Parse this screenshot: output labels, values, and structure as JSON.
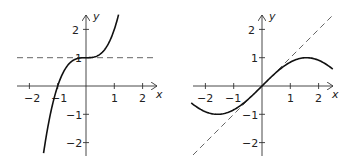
{
  "chart_data": [
    {
      "type": "line",
      "title": "",
      "xlabel": "x",
      "ylabel": "y",
      "xlim": [
        -2.5,
        2.5
      ],
      "ylim": [
        -2.5,
        2.5
      ],
      "x_ticks": [
        "-2",
        "-1",
        "1",
        "2"
      ],
      "y_ticks": [
        "2",
        "1",
        "-1",
        "-2"
      ],
      "grid": false,
      "series": [
        {
          "name": "y = x^3 + 1",
          "style": "solid",
          "x_range": [
            -1.5,
            1.15
          ]
        },
        {
          "name": "y = 1",
          "style": "dashed",
          "x_range": [
            -2.5,
            2.5
          ]
        }
      ]
    },
    {
      "type": "line",
      "title": "",
      "xlabel": "x",
      "ylabel": "y",
      "xlim": [
        -2.5,
        2.5
      ],
      "ylim": [
        -2.5,
        2.5
      ],
      "x_ticks": [
        "-2",
        "-1",
        "1",
        "2"
      ],
      "y_ticks": [
        "2",
        "1",
        "-1",
        "-2"
      ],
      "grid": false,
      "series": [
        {
          "name": "y = sin x",
          "style": "solid",
          "x_range": [
            -2.5,
            2.5
          ]
        },
        {
          "name": "y = x",
          "style": "dashed",
          "x_range": [
            -2.5,
            2.5
          ]
        }
      ]
    }
  ],
  "plots": {
    "left": {
      "x_label": "x",
      "y_label": "y",
      "xt": {
        "m2": "−2",
        "m1": "−1",
        "p1": "1",
        "p2": "2"
      },
      "yt": {
        "p2": "2",
        "p1": "1",
        "m1": "−1",
        "m2": "−2"
      }
    },
    "right": {
      "x_label": "x",
      "y_label": "y",
      "xt": {
        "m2": "−2",
        "m1": "−1",
        "p1": "1",
        "p2": "2"
      },
      "yt": {
        "p2": "2",
        "p1": "1",
        "m1": "−1",
        "m2": "−2"
      }
    }
  }
}
